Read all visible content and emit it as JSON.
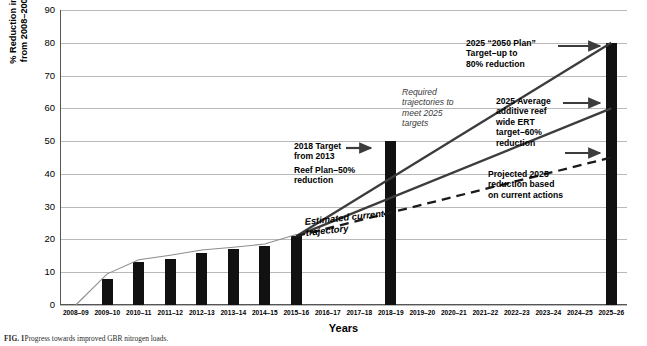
{
  "chart_data": {
    "type": "bar",
    "title": "",
    "xlabel": "Years",
    "ylabel": "% Reduction in DIN loads from 2008–2009 baseline",
    "ylim": [
      0,
      90
    ],
    "ytick_step": 10,
    "grid": true,
    "legend": "none",
    "categories": [
      "2008–09",
      "2009–10",
      "2010–11",
      "2011–12",
      "2012–13",
      "2013–14",
      "2014–15",
      "2015–16",
      "2016–17",
      "2017–18",
      "2018–19",
      "2019–20",
      "2020–21",
      "2021–22",
      "2022–23",
      "2023–24",
      "2024–25",
      "2025–26"
    ],
    "yticks": [
      "0",
      "10",
      "20",
      "30",
      "40",
      "50",
      "60",
      "70",
      "80",
      "90"
    ],
    "series": [
      {
        "name": "Reported DIN load reduction (bars)",
        "type": "bar",
        "values": [
          null,
          8,
          13,
          14,
          16,
          17,
          18,
          21,
          null,
          null,
          50,
          null,
          null,
          null,
          null,
          null,
          null,
          80
        ]
      },
      {
        "name": "Cumulative modelled reduction (thin line)",
        "type": "line",
        "x": [
          "2008–09",
          "2009–10",
          "2010–11",
          "2011–12",
          "2012–13",
          "2013–14",
          "2014–15",
          "2015–16"
        ],
        "values": [
          0,
          9.5,
          13.8,
          15.2,
          16.8,
          17.6,
          18.6,
          21.5
        ]
      },
      {
        "name": "Required trajectory to 2025 “2050 Plan” target (80%)",
        "type": "line",
        "x": [
          "2015–16",
          "2025–26"
        ],
        "values": [
          21,
          80
        ]
      },
      {
        "name": "Required trajectory to 2025 average additive reef wide ERT target (60%)",
        "type": "line",
        "x": [
          "2015–16",
          "2025–26"
        ],
        "values": [
          21,
          60
        ]
      },
      {
        "name": "Estimated current trajectory (dashed)",
        "type": "line-dashed",
        "x": [
          "2015–16",
          "2025–26"
        ],
        "values": [
          21,
          45
        ]
      }
    ],
    "annotations": [
      {
        "name": "annotation-2018-target",
        "lines": [
          "2018 Target",
          "from 2013",
          "Reef Plan–50%",
          "reduction"
        ],
        "style": "bold",
        "points_to": "2018–19 bar (50%)"
      },
      {
        "name": "annotation-required-trajectories",
        "lines": [
          "Required",
          "trajectories to",
          "meet 2025",
          "targets"
        ],
        "style": "italic",
        "points_to": "trajectory lines"
      },
      {
        "name": "annotation-2050-plan-target",
        "lines": [
          "2025 “2050 Plan”",
          "Target–up to",
          "80% reduction"
        ],
        "style": "bold",
        "points_to": "80% level on 2025–26 bar"
      },
      {
        "name": "annotation-ert-target",
        "lines": [
          "2025 Average",
          "additive reef",
          "wide ERT",
          "target–60%",
          "reduction"
        ],
        "style": "bold",
        "points_to": "60% level on 2025–26 bar"
      },
      {
        "name": "annotation-projected-2025",
        "lines": [
          "Projected 2025",
          "reduction based",
          "on current actions"
        ],
        "style": "bold",
        "points_to": "45% level on 2025–26 bar"
      },
      {
        "name": "annotation-estimated-current-trajectory",
        "lines": [
          "Estimated current",
          "trajectory"
        ],
        "style": "bold-italic",
        "points_to": "dashed line"
      }
    ]
  },
  "caption": {
    "label": "FIG. 1",
    "text": "Progress towards improved GBR nitrogen loads."
  },
  "colors": {
    "bar": "#111111",
    "grid": "#b9b9b9",
    "axis": "#555555",
    "trajectory": "#3c3c3c",
    "text": "#000000"
  }
}
